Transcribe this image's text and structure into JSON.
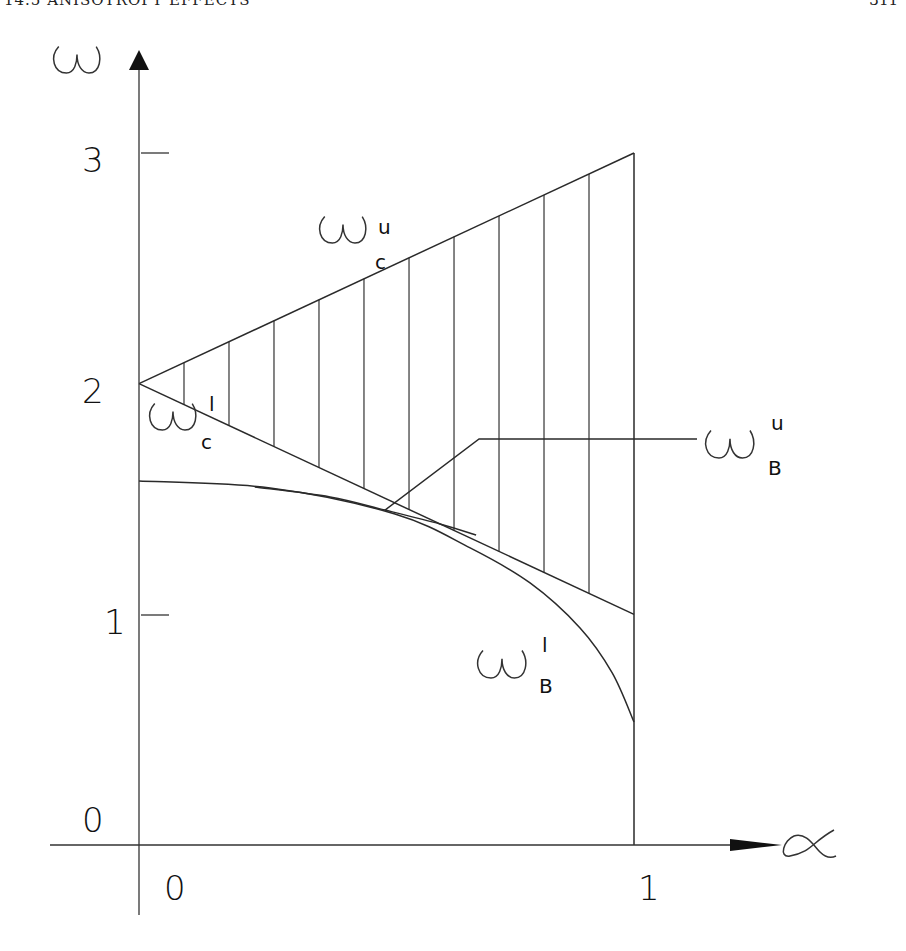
{
  "header": {
    "left": "14.5  ANISOTROPY EFFECTS",
    "right": "311"
  },
  "chart_data": {
    "type": "line",
    "title": "",
    "xlabel": "α",
    "ylabel": "ω",
    "xlim": [
      0,
      1
    ],
    "ylim": [
      0,
      3
    ],
    "grid": false,
    "x_ticks": [
      "0",
      "1"
    ],
    "y_ticks": [
      "0",
      "1",
      "2",
      "3"
    ],
    "hatched_region": {
      "description": "region between ω_c^l and ω_c^u, vertical hatching",
      "hatch_alphas": [
        0.0909,
        0.1818,
        0.2727,
        0.3636,
        0.4545,
        0.5455,
        0.6364,
        0.7273,
        0.8182,
        0.9091
      ]
    },
    "series": [
      {
        "name": "ω_c^u",
        "label_main": "ω",
        "label_sub": "c",
        "label_sup": "u",
        "x": [
          0,
          1
        ],
        "y": [
          2,
          3
        ]
      },
      {
        "name": "ω_c^l",
        "label_main": "ω",
        "label_sub": "c",
        "label_sup": "l",
        "x": [
          0,
          1
        ],
        "y": [
          2,
          1
        ]
      },
      {
        "name": "ω_B^l",
        "label_main": "ω",
        "label_sub": "B",
        "label_sup": "l",
        "x": [
          0,
          0.265,
          0.517,
          0.669,
          0.79,
          0.891,
          0.956,
          1.0
        ],
        "y": [
          1.578,
          1.548,
          1.435,
          1.288,
          1.136,
          0.941,
          0.746,
          0.533
        ]
      },
      {
        "name": "ω_B^u",
        "label_main": "ω",
        "label_sub": "B",
        "label_sup": "u",
        "x": [
          0.234,
          0.386,
          0.497,
          0.608,
          0.681
        ],
        "y": [
          1.552,
          1.509,
          1.452,
          1.392,
          1.344
        ]
      }
    ],
    "annotations": [
      {
        "text": "ω_B^u",
        "leader_from": [
          0.497,
          1.452
        ],
        "leader_to": [
          0.687,
          1.76
        ],
        "label_at_alpha": 1.13
      }
    ]
  }
}
